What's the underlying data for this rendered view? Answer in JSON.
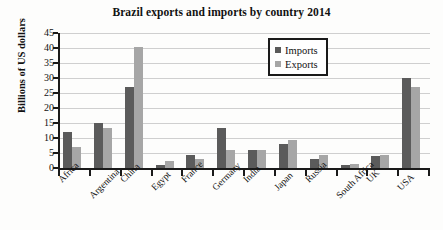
{
  "chart_data": {
    "type": "bar",
    "title": "Brazil exports and imports by country 2014",
    "xlabel": "",
    "ylabel": "Billions of US dollars",
    "ylim": [
      0,
      45
    ],
    "yticks": [
      0,
      5,
      10,
      15,
      20,
      25,
      30,
      35,
      40,
      45
    ],
    "grid": true,
    "legend_position": "upper-right-inside",
    "categories": [
      "Africa",
      "Argentina",
      "China",
      "Egypt",
      "France",
      "Germany",
      "India",
      "Japan",
      "Russia",
      "South Africa",
      "UK",
      "USA"
    ],
    "series": [
      {
        "name": "Imports",
        "color": "#5b5b5b",
        "values": [
          12,
          15,
          27,
          1,
          4.5,
          13.5,
          6,
          8,
          3,
          1,
          4,
          30
        ]
      },
      {
        "name": "Exports",
        "color": "#a6a6a6",
        "values": [
          7,
          13.5,
          40.5,
          2.5,
          3,
          6,
          6,
          9.5,
          4.5,
          1.5,
          4.5,
          27
        ]
      }
    ]
  },
  "legend": {
    "items": [
      {
        "label": "Imports",
        "color": "#5b5b5b"
      },
      {
        "label": "Exports",
        "color": "#a6a6a6"
      }
    ]
  }
}
